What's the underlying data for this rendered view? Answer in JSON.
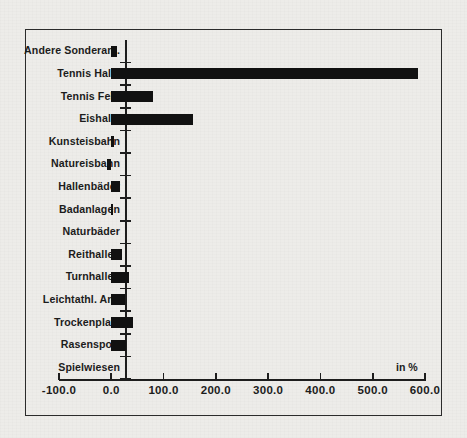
{
  "unit_label": "in %",
  "chart_data": {
    "type": "bar",
    "orientation": "horizontal",
    "title": "",
    "subtitle": "",
    "xlabel": "in %",
    "ylabel": "",
    "xlim": [
      -100.0,
      600.0
    ],
    "xticks": [
      "-100.0",
      "0.0",
      "100.0",
      "200.0",
      "300.0",
      "400.0",
      "500.0",
      "600.0"
    ],
    "xtick_values": [
      -100,
      0,
      100,
      200,
      300,
      400,
      500,
      600
    ],
    "grid": false,
    "legend": "none",
    "bar_color": "#111111",
    "categories": [
      "Andere Sonderanl.",
      "Tennis Halle",
      "Tennis Feld",
      "Eishalle",
      "Kunsteisbahn",
      "Natureisbahn",
      "Hallenbäder",
      "Badanlagen",
      "Naturbäder",
      "Reithallen",
      "Turnhallen",
      "Leichtathl. Anl.",
      "Trockenplatz",
      "Rasensport",
      "Spielwiesen"
    ],
    "values": [
      11,
      586,
      80,
      157,
      5,
      -9,
      16,
      3,
      0,
      20,
      33,
      26,
      41,
      28,
      0
    ]
  }
}
